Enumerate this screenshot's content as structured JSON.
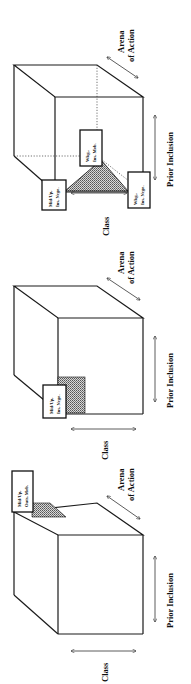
{
  "figure": {
    "orientation": "rotated-90-ccw",
    "pattern_fill": "#9a9a9a",
    "axes": {
      "class_label": "Class",
      "arena_label_line1": "Arena",
      "arena_label_line2": "of Action",
      "prior_inclusion_label": "Prior Inclusion"
    },
    "panels": [
      {
        "position": "left",
        "boxes": [
          {
            "line1": "Mid/Up,",
            "line2": "Outs, Mob."
          }
        ]
      },
      {
        "position": "middle",
        "boxes": [
          {
            "line1": "Mid/Up,",
            "line2": "Ins, Nego."
          }
        ]
      },
      {
        "position": "right",
        "boxes": [
          {
            "line1": "Mid/Up,",
            "line2": "Ins, Nego."
          },
          {
            "line1": "Wkg.,",
            "line2": "Ins, Mob."
          },
          {
            "line1": "Wkg.,",
            "line2": "Ins, Nego."
          }
        ]
      }
    ]
  }
}
